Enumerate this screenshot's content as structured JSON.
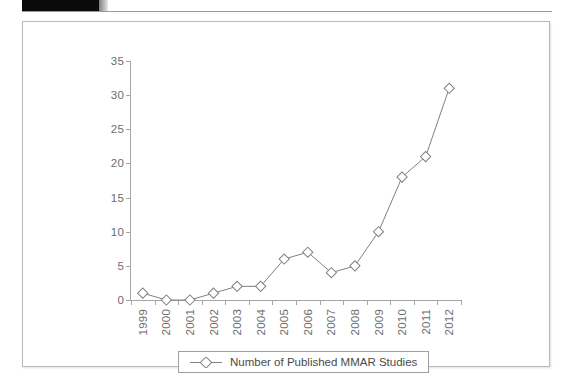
{
  "header": {
    "redaction_label": "",
    "icon": "redaction-block"
  },
  "chart_data": {
    "type": "line",
    "title": "",
    "subtitle": "",
    "xlabel": "",
    "ylabel": "",
    "categories": [
      "1999",
      "2000",
      "2001",
      "2002",
      "2003",
      "2004",
      "2005",
      "2006",
      "2007",
      "2008",
      "2009",
      "2010",
      "2011",
      "2012"
    ],
    "series": [
      {
        "name": "Number of Published MMAR Studies",
        "values": [
          1,
          0,
          0,
          1,
          2,
          2,
          6,
          7,
          4,
          5,
          10,
          18,
          21,
          31
        ],
        "marker": "diamond",
        "line_color": "#808080",
        "marker_fill": "#ffffff"
      }
    ],
    "ylim": [
      0,
      35
    ],
    "yticks": [
      0,
      5,
      10,
      15,
      20,
      25,
      30,
      35
    ],
    "ytick_labels": [
      "0",
      "5",
      "10",
      "15",
      "20",
      "25",
      "30",
      "35"
    ],
    "grid": false,
    "legend_position": "bottom-center",
    "legend": [
      "Number of Published MMAR Studies"
    ],
    "annotations": []
  },
  "legend": {
    "label": "Number of Published MMAR Studies",
    "marker_icon": "diamond-marker-icon"
  },
  "colors": {
    "axis": "#a6a6a6",
    "tick_text": "#6d6d6d",
    "series_line": "#808080",
    "frame_border": "#b9b9b9",
    "legend_border": "#9e9e9e",
    "redaction": "#0a0a0a"
  }
}
